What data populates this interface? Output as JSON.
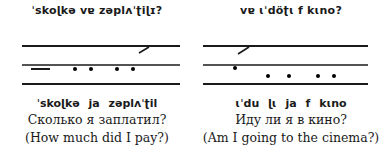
{
  "examples": [
    {
      "ipa_top": "ˈskoɭkə vɐ zəplʌˈʈiɭɪ?",
      "ipa_bottom": "ˈskoɭkə ja zəplʌˈʈil",
      "russian": "Сколько я заплатил?",
      "english": "(How much did I pay?)",
      "staff": {
        "lines_y": [
          46,
          65,
          84
        ],
        "x_start": 22,
        "x_end": 180,
        "dash": {
          "x1": 31,
          "x2": 50,
          "y": 69
        },
        "dots": [
          {
            "x": 75,
            "y": 69
          },
          {
            "x": 91,
            "y": 69
          },
          {
            "x": 117,
            "y": 69
          },
          {
            "x": 133,
            "y": 69
          }
        ],
        "rise": {
          "x1": 139,
          "y1": 53,
          "x2": 149,
          "y2": 47
        }
      }
    },
    {
      "ipa_top": "vɐ ɩˈdöʈɩ f kɩno?",
      "ipa_bottom": "ɩˈdu ɭɩ ja f kɩno",
      "russian": "Иду ли я в кино?",
      "english": "(Am I going to the cinema?)",
      "staff": {
        "lines_y": [
          46,
          65,
          84
        ],
        "x_start": 203,
        "x_end": 368,
        "dot_high": {
          "x": 235,
          "y": 68
        },
        "dots": [
          {
            "x": 268,
            "y": 76
          },
          {
            "x": 289,
            "y": 76
          },
          {
            "x": 318,
            "y": 76
          },
          {
            "x": 334,
            "y": 76
          }
        ],
        "rise": {
          "x1": 238,
          "y1": 54,
          "x2": 249,
          "y2": 47
        }
      }
    }
  ]
}
